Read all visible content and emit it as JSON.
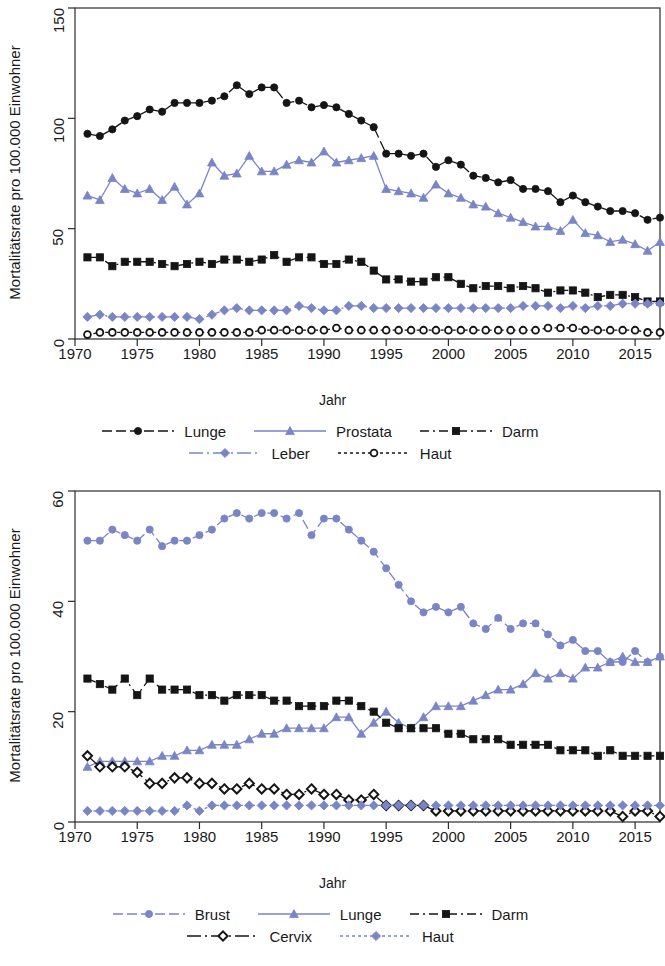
{
  "colors": {
    "black": "#151515",
    "blue": "#7a85c8",
    "axis": "#2b2b2b",
    "background": "#ffffff"
  },
  "figures": [
    {
      "id": "men",
      "axis_title_y": "Mortalitätsrate pro 100.000 Einwohner",
      "axis_title_x": "Jahr",
      "ytick_labels": [
        "0",
        "50",
        "100",
        "150"
      ],
      "xtick_labels": [
        "1970",
        "1975",
        "1980",
        "1985",
        "1990",
        "1995",
        "2000",
        "2005",
        "2010",
        "2015"
      ],
      "legend": [
        [
          {
            "label": "Lunge",
            "color": "#151515",
            "marker": "circle-filled",
            "dash": "10 4"
          },
          {
            "label": "Prostata",
            "color": "#7a85c8",
            "marker": "triangle-filled",
            "dash": "none"
          },
          {
            "label": "Darm",
            "color": "#151515",
            "marker": "square-filled",
            "dash": "9 4 2 4"
          }
        ],
        [
          {
            "label": "Leber",
            "color": "#7a85c8",
            "marker": "diamond-filled",
            "dash": "14 4 2 4"
          },
          {
            "label": "Haut",
            "color": "#151515",
            "marker": "circle-open",
            "dash": "3 3"
          }
        ]
      ]
    },
    {
      "id": "women",
      "axis_title_y": "Mortalitätsrate pro 100.000 Einwohner",
      "axis_title_x": "Jahr",
      "ytick_labels": [
        "0",
        "20",
        "40",
        "60"
      ],
      "xtick_labels": [
        "1970",
        "1975",
        "1980",
        "1985",
        "1990",
        "1995",
        "2000",
        "2005",
        "2010",
        "2015"
      ],
      "legend": [
        [
          {
            "label": "Brust",
            "color": "#7a85c8",
            "marker": "circle-filled",
            "dash": "10 4"
          },
          {
            "label": "Lunge",
            "color": "#7a85c8",
            "marker": "triangle-filled",
            "dash": "none"
          },
          {
            "label": "Darm",
            "color": "#151515",
            "marker": "square-filled",
            "dash": "9 4 2 4"
          }
        ],
        [
          {
            "label": "Cervix",
            "color": "#151515",
            "marker": "diamond-open",
            "dash": "14 4 2 4"
          },
          {
            "label": "Haut",
            "color": "#7a85c8",
            "marker": "diamond-filled",
            "dash": "3 3"
          }
        ]
      ]
    }
  ],
  "chart_data": [
    {
      "type": "line",
      "title": "Mortalitätsrate Männer",
      "xlabel": "Jahr",
      "ylabel": "Mortalitätsrate pro 100.000 Einwohner",
      "xlim": [
        1970,
        2017
      ],
      "ylim": [
        0,
        150
      ],
      "yticks": [
        0,
        50,
        100,
        150
      ],
      "xticks": [
        1970,
        1975,
        1980,
        1985,
        1990,
        1995,
        2000,
        2005,
        2010,
        2015
      ],
      "grid": false,
      "legend_position": "below",
      "x": [
        1971,
        1972,
        1973,
        1974,
        1975,
        1976,
        1977,
        1978,
        1979,
        1980,
        1981,
        1982,
        1983,
        1984,
        1985,
        1986,
        1987,
        1988,
        1989,
        1990,
        1991,
        1992,
        1993,
        1994,
        1995,
        1996,
        1997,
        1998,
        1999,
        2000,
        2001,
        2002,
        2003,
        2004,
        2005,
        2006,
        2007,
        2008,
        2009,
        2010,
        2011,
        2012,
        2013,
        2014,
        2015,
        2016,
        2017
      ],
      "series": [
        {
          "name": "Lunge",
          "color": "#151515",
          "marker": "circle-filled",
          "values": [
            93,
            92,
            95,
            99,
            101,
            104,
            103,
            107,
            107,
            107,
            108,
            110,
            115,
            111,
            114,
            114,
            107,
            108,
            105,
            106,
            105,
            102,
            99,
            96,
            84,
            84,
            83,
            84,
            78,
            81,
            79,
            74,
            73,
            71,
            72,
            68,
            68,
            67,
            62,
            65,
            62,
            60,
            58,
            58,
            57,
            54,
            55
          ]
        },
        {
          "name": "Prostata",
          "color": "#7a85c8",
          "marker": "triangle-filled",
          "values": [
            65,
            63,
            73,
            68,
            66,
            68,
            63,
            69,
            61,
            66,
            80,
            74,
            75,
            83,
            76,
            76,
            79,
            81,
            80,
            85,
            80,
            81,
            82,
            83,
            68,
            67,
            66,
            64,
            70,
            66,
            64,
            61,
            60,
            57,
            55,
            53,
            51,
            51,
            49,
            54,
            48,
            47,
            44,
            45,
            43,
            40,
            44
          ]
        },
        {
          "name": "Darm",
          "color": "#151515",
          "marker": "square-filled",
          "values": [
            37,
            37,
            33,
            35,
            35,
            35,
            34,
            33,
            34,
            35,
            34,
            36,
            36,
            35,
            36,
            38,
            35,
            37,
            37,
            34,
            34,
            36,
            35,
            31,
            27,
            27,
            26,
            26,
            28,
            28,
            25,
            23,
            24,
            24,
            23,
            24,
            23,
            21,
            22,
            22,
            21,
            19,
            20,
            20,
            19,
            17,
            17
          ]
        },
        {
          "name": "Leber",
          "color": "#7a85c8",
          "marker": "diamond-filled",
          "values": [
            10,
            11,
            10,
            10,
            10,
            10,
            10,
            10,
            10,
            9,
            11,
            13,
            14,
            13,
            13,
            13,
            13,
            15,
            14,
            13,
            13,
            15,
            15,
            14,
            14,
            14,
            14,
            14,
            14,
            14,
            14,
            14,
            14,
            14,
            14,
            15,
            15,
            15,
            14,
            15,
            14,
            15,
            15,
            16,
            16,
            16,
            16
          ]
        },
        {
          "name": "Haut",
          "color": "#151515",
          "marker": "circle-open",
          "values": [
            2,
            3,
            3,
            3,
            3,
            3,
            3,
            3,
            3,
            3,
            3,
            3,
            3,
            3,
            4,
            4,
            4,
            4,
            4,
            4,
            5,
            4,
            4,
            4,
            4,
            4,
            4,
            4,
            4,
            4,
            4,
            4,
            4,
            4,
            4,
            4,
            4,
            5,
            5,
            5,
            4,
            4,
            4,
            4,
            4,
            3,
            3
          ]
        }
      ]
    },
    {
      "type": "line",
      "title": "Mortalitätsrate Frauen",
      "xlabel": "Jahr",
      "ylabel": "Mortalitätsrate pro 100.000 Einwohner",
      "xlim": [
        1970,
        2017
      ],
      "ylim": [
        0,
        60
      ],
      "yticks": [
        0,
        20,
        40,
        60
      ],
      "xticks": [
        1970,
        1975,
        1980,
        1985,
        1990,
        1995,
        2000,
        2005,
        2010,
        2015
      ],
      "grid": false,
      "legend_position": "below",
      "x": [
        1971,
        1972,
        1973,
        1974,
        1975,
        1976,
        1977,
        1978,
        1979,
        1980,
        1981,
        1982,
        1983,
        1984,
        1985,
        1986,
        1987,
        1988,
        1989,
        1990,
        1991,
        1992,
        1993,
        1994,
        1995,
        1996,
        1997,
        1998,
        1999,
        2000,
        2001,
        2002,
        2003,
        2004,
        2005,
        2006,
        2007,
        2008,
        2009,
        2010,
        2011,
        2012,
        2013,
        2014,
        2015,
        2016,
        2017
      ],
      "series": [
        {
          "name": "Brust",
          "color": "#7a85c8",
          "marker": "circle-filled",
          "values": [
            51,
            51,
            53,
            52,
            51,
            53,
            50,
            51,
            51,
            52,
            53,
            55,
            56,
            55,
            56,
            56,
            55,
            56,
            52,
            55,
            55,
            53,
            51,
            49,
            46,
            43,
            40,
            38,
            39,
            38,
            39,
            36,
            35,
            37,
            35,
            36,
            36,
            34,
            32,
            33,
            31,
            31,
            29,
            29,
            31,
            29,
            30
          ]
        },
        {
          "name": "Lunge",
          "color": "#7a85c8",
          "marker": "triangle-filled",
          "values": [
            10,
            11,
            11,
            11,
            11,
            11,
            12,
            12,
            13,
            13,
            14,
            14,
            14,
            15,
            16,
            16,
            17,
            17,
            17,
            17,
            19,
            19,
            16,
            18,
            20,
            18,
            17,
            19,
            21,
            21,
            21,
            22,
            23,
            24,
            24,
            25,
            27,
            26,
            27,
            26,
            28,
            28,
            29,
            30,
            29,
            29,
            30
          ]
        },
        {
          "name": "Darm",
          "color": "#151515",
          "marker": "square-filled",
          "values": [
            26,
            25,
            24,
            26,
            23,
            26,
            24,
            24,
            24,
            23,
            23,
            22,
            23,
            23,
            23,
            22,
            22,
            21,
            21,
            21,
            22,
            22,
            21,
            20,
            18,
            17,
            17,
            17,
            17,
            16,
            16,
            15,
            15,
            15,
            14,
            14,
            14,
            14,
            13,
            13,
            13,
            12,
            13,
            12,
            12,
            12,
            12
          ]
        },
        {
          "name": "Cervix",
          "color": "#151515",
          "marker": "diamond-open",
          "values": [
            12,
            10,
            10,
            10,
            9,
            7,
            7,
            8,
            8,
            7,
            7,
            6,
            6,
            7,
            6,
            6,
            5,
            5,
            6,
            5,
            5,
            4,
            4,
            5,
            3,
            3,
            3,
            3,
            2,
            2,
            2,
            2,
            2,
            2,
            2,
            2,
            2,
            2,
            2,
            2,
            2,
            2,
            2,
            1,
            2,
            2,
            1
          ]
        },
        {
          "name": "Haut",
          "color": "#7a85c8",
          "marker": "diamond-filled",
          "values": [
            2,
            2,
            2,
            2,
            2,
            2,
            2,
            2,
            3,
            2,
            3,
            3,
            3,
            3,
            3,
            3,
            3,
            3,
            3,
            3,
            3,
            3,
            3,
            3,
            3,
            3,
            3,
            3,
            3,
            3,
            3,
            3,
            3,
            3,
            3,
            3,
            3,
            3,
            3,
            3,
            3,
            3,
            3,
            3,
            3,
            3,
            3
          ]
        }
      ]
    }
  ]
}
